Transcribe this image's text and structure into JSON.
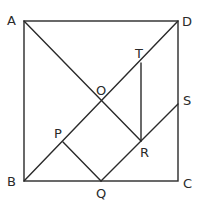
{
  "diagram": {
    "type": "geometry",
    "colors": {
      "stroke": "#2a2a2a",
      "background": "#ffffff"
    },
    "points": {
      "A": {
        "label": "A",
        "x": 24,
        "y": 21
      },
      "B": {
        "label": "B",
        "x": 24,
        "y": 181
      },
      "C": {
        "label": "C",
        "x": 178,
        "y": 181
      },
      "D": {
        "label": "D",
        "x": 178,
        "y": 21
      },
      "O": {
        "label": "O",
        "x": 101,
        "y": 101
      },
      "T": {
        "label": "T",
        "x": 141,
        "y": 63
      },
      "S": {
        "label": "S",
        "x": 178,
        "y": 104
      },
      "P": {
        "label": "P",
        "x": 63,
        "y": 142
      },
      "Q": {
        "label": "Q",
        "x": 101,
        "y": 181
      },
      "R": {
        "label": "R",
        "x": 141,
        "y": 141
      }
    },
    "segments": [
      "AB",
      "BC",
      "CD",
      "DA",
      "AC",
      "BD",
      "PQ",
      "QS",
      "TR"
    ]
  }
}
